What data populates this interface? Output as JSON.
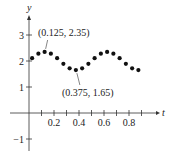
{
  "chart_data": {
    "type": "scatter",
    "title": "",
    "xlabel": "t",
    "ylabel": "y",
    "xlim": [
      -0.2,
      1.0
    ],
    "ylim": [
      -1.3,
      3.9
    ],
    "x_ticks": [
      0.1,
      0.2,
      0.3,
      0.4,
      0.5,
      0.6,
      0.7,
      0.8,
      0.9
    ],
    "x_tick_labels": [
      "0.2",
      "0.4",
      "0.6",
      "0.8"
    ],
    "x_tick_label_values": [
      0.2,
      0.4,
      0.6,
      0.8
    ],
    "y_ticks": [
      -1,
      1,
      2,
      3
    ],
    "y_tick_labels": [
      "−1",
      "1",
      "2",
      "3"
    ],
    "grid": false,
    "series": [
      {
        "name": "data",
        "x": [
          0.025,
          0.075,
          0.125,
          0.175,
          0.225,
          0.275,
          0.325,
          0.375,
          0.425,
          0.475,
          0.525,
          0.575,
          0.625,
          0.675,
          0.725,
          0.775,
          0.825,
          0.875
        ],
        "y": [
          2.11,
          2.28,
          2.35,
          2.28,
          2.11,
          1.89,
          1.72,
          1.65,
          1.72,
          1.89,
          2.11,
          2.28,
          2.35,
          2.28,
          2.11,
          1.89,
          1.72,
          1.65
        ],
        "marker": "circle",
        "color": "#111111"
      }
    ],
    "annotations": [
      {
        "text": "(0.125, 2.35)",
        "x": 0.125,
        "y": 2.35
      },
      {
        "text": "(0.375, 1.65)",
        "x": 0.375,
        "y": 1.65
      }
    ]
  }
}
